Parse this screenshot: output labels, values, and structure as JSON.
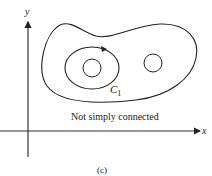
{
  "figure": {
    "caption": "(c)",
    "region_label": "Not simply connected",
    "curve_label": "C",
    "curve_label_subscript": "1",
    "axes": {
      "x_label": "x",
      "y_label": "y"
    },
    "colors": {
      "stroke": "#222222",
      "background": "#ffffff"
    }
  }
}
